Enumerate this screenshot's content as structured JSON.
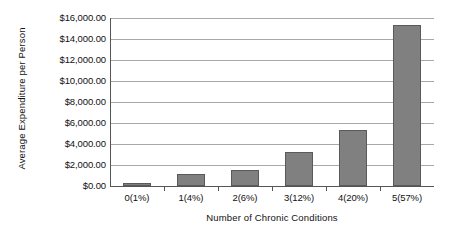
{
  "chart_data": {
    "type": "bar",
    "title": "",
    "xlabel": "Number of Chronic Conditions",
    "ylabel": "Average Expenditure per Person",
    "categories": [
      "0(1%)",
      "1(4%)",
      "2(6%)",
      "3(12%)",
      "4(20%)",
      "5(57%)"
    ],
    "values": [
      250,
      1150,
      1500,
      3250,
      5300,
      15300
    ],
    "ylim": [
      0,
      16000
    ],
    "ytick_values": [
      0,
      2000,
      4000,
      6000,
      8000,
      10000,
      12000,
      14000,
      16000
    ],
    "ytick_labels": [
      "$0.00",
      "$2,000.00",
      "$4,000.00",
      "$6,000.00",
      "$8,000.00",
      "$10,000.00",
      "$12,000.00",
      "$14,000.00",
      "$16,000.00"
    ],
    "grid": true,
    "legend": false,
    "bar_color": "#808080",
    "bar_border_color": "#5a5a5a",
    "gridline_color": "#a8a8a8",
    "axis_color": "#555555",
    "background_color": "#ffffff"
  }
}
